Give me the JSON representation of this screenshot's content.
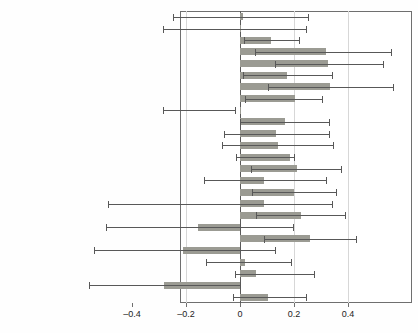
{
  "chart_data": {
    "type": "bar",
    "orientation": "horizontal",
    "title": "",
    "subtitle": "",
    "xlabel": "",
    "ylabel": "",
    "xlim": [
      -0.62,
      0.56
    ],
    "xticks": [
      -0.4,
      -0.2,
      0,
      0.2,
      0.4
    ],
    "xticklabels": [
      "–0.4",
      "–0.2",
      "0",
      "0.2",
      "0.4"
    ],
    "grid": true,
    "grid_axis": "x",
    "legend": "none",
    "zero_reference_line": 0,
    "error_bars": "horizontal whiskers with end caps",
    "bar_color": "#9b9b93",
    "error_color": "#585858",
    "grid_color": "#d7d7d7",
    "axis_color": "#6f6f6f",
    "categories": [
      "Breyer",
      "Ginsburg",
      "Thomas**",
      "Souter**",
      "Kennedy***",
      "Scalia***",
      "O'Connor***",
      "Stevens**",
      "Rehnquist",
      "Powell*",
      "Blackmun",
      "Burger",
      "Marshall",
      "Fortas**",
      "White",
      "Stewart*",
      "Whittaker",
      "Brennan**",
      "Harlan",
      "Warren***",
      "Clark",
      "Burton",
      "Douglas**",
      "Frankfurter",
      "Black"
    ],
    "values": [
      0.012,
      0.0,
      0.115,
      0.32,
      0.325,
      0.175,
      0.335,
      0.205,
      0.0,
      0.165,
      0.135,
      0.14,
      0.185,
      0.21,
      0.09,
      0.2,
      0.09,
      0.225,
      -0.155,
      0.26,
      -0.21,
      0.02,
      0.06,
      -0.28,
      0.105
    ],
    "ci_low": [
      -0.25,
      -0.285,
      0.015,
      0.055,
      0.13,
      0.01,
      0.105,
      0.02,
      -0.285,
      0.0,
      -0.06,
      -0.065,
      -0.015,
      0.04,
      -0.135,
      0.045,
      -0.49,
      0.06,
      -0.495,
      0.09,
      -0.54,
      -0.125,
      -0.02,
      -0.56,
      -0.025
    ],
    "ci_high": [
      0.25,
      0.245,
      0.22,
      0.56,
      0.53,
      0.34,
      0.565,
      0.305,
      -0.02,
      0.33,
      0.33,
      0.345,
      0.2,
      0.375,
      0.32,
      0.355,
      0.34,
      0.39,
      0.195,
      0.43,
      0.13,
      0.19,
      0.275,
      0.0,
      0.245
    ]
  },
  "axis": {
    "x_tick_labels": [
      "–0.4",
      "–0.2",
      "0",
      "0.2",
      "0.4"
    ]
  }
}
